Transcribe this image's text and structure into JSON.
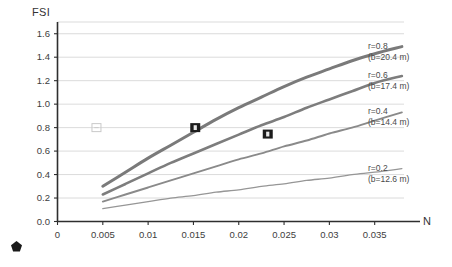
{
  "chart_data": {
    "type": "line",
    "title": "",
    "subtitle": "",
    "xlabel": "N",
    "ylabel": "FSI",
    "xlim": [
      0,
      0.04
    ],
    "ylim": [
      0,
      1.7
    ],
    "grid": true,
    "grid_axis": "y",
    "legend_position": "right-inline",
    "xticks": [
      "0",
      "0.005",
      "0.01",
      "0.015",
      "0.02",
      "0.025",
      "0.03",
      "0.035"
    ],
    "xtick_values": [
      0,
      0.005,
      0.01,
      0.015,
      0.02,
      0.025,
      0.03,
      0.035
    ],
    "yticks": [
      "0.0",
      "0.2",
      "0.4",
      "0.6",
      "0.8",
      "1.0",
      "1.2",
      "1.4",
      "1.6"
    ],
    "ytick_values": [
      0.0,
      0.2,
      0.4,
      0.6,
      0.8,
      1.0,
      1.2,
      1.4,
      1.6
    ],
    "x": [
      0.005,
      0.0075,
      0.01,
      0.0125,
      0.015,
      0.0175,
      0.02,
      0.0225,
      0.025,
      0.0275,
      0.03,
      0.0325,
      0.035,
      0.038
    ],
    "series": [
      {
        "name": "r=0.8",
        "label_main": "r=0.8",
        "label_sub": "(b=20.4 m)",
        "r": 0.8,
        "b": 20.4,
        "color": "#7a7a7a",
        "width": 3.0,
        "values": [
          0.3,
          0.42,
          0.54,
          0.65,
          0.76,
          0.87,
          0.97,
          1.06,
          1.15,
          1.23,
          1.3,
          1.37,
          1.43,
          1.49
        ]
      },
      {
        "name": "r=0.6",
        "label_main": "r=0.6",
        "label_sub": "(b=17.4 m)",
        "r": 0.6,
        "b": 17.4,
        "color": "#7d7d7d",
        "width": 2.6,
        "values": [
          0.23,
          0.32,
          0.41,
          0.5,
          0.58,
          0.66,
          0.74,
          0.82,
          0.89,
          0.97,
          1.04,
          1.11,
          1.18,
          1.24
        ]
      },
      {
        "name": "r=0.4",
        "label_main": "r=0.4",
        "label_sub": "(b=14.4 m)",
        "r": 0.4,
        "b": 14.4,
        "color": "#8a8a8a",
        "width": 1.9,
        "values": [
          0.17,
          0.23,
          0.29,
          0.35,
          0.41,
          0.47,
          0.53,
          0.58,
          0.64,
          0.69,
          0.75,
          0.8,
          0.86,
          0.93
        ]
      },
      {
        "name": "r=0.2",
        "label_main": "r=0.2",
        "label_sub": "(b=12.6 m)",
        "r": 0.2,
        "b": 12.6,
        "color": "#969696",
        "width": 1.3,
        "values": [
          0.11,
          0.14,
          0.17,
          0.2,
          0.22,
          0.25,
          0.27,
          0.3,
          0.32,
          0.35,
          0.37,
          0.4,
          0.42,
          0.45
        ]
      }
    ],
    "markers": [
      {
        "name": "marker-point-1",
        "x": 0.0152,
        "y": 0.8,
        "style": "filled-square",
        "color": "#1c1c1c"
      },
      {
        "name": "marker-point-2",
        "x": 0.0232,
        "y": 0.745,
        "style": "filled-square",
        "color": "#1c1c1c"
      }
    ],
    "ghost_markers": [
      {
        "name": "ghost-marker-1",
        "x": 0.0043,
        "y": 0.8,
        "style": "outline-square",
        "color": "#c9c9c9"
      }
    ],
    "annotations": []
  },
  "decor": {
    "corner_badge_name": "pentagon-badge-icon"
  }
}
